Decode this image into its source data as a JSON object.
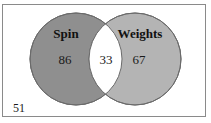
{
  "diagram": {
    "type": "venn",
    "sets": [
      {
        "label": "Spin",
        "only_count": "86",
        "fill": "#8f8f8f"
      },
      {
        "label": "Weights",
        "only_count": "67",
        "fill": "#b4b4b4"
      }
    ],
    "intersection": {
      "count": "33",
      "fill": "#ffffff"
    },
    "outside": {
      "count": "51"
    },
    "stroke": "#6a6a6a",
    "frame_border": "#8a8a8a"
  }
}
